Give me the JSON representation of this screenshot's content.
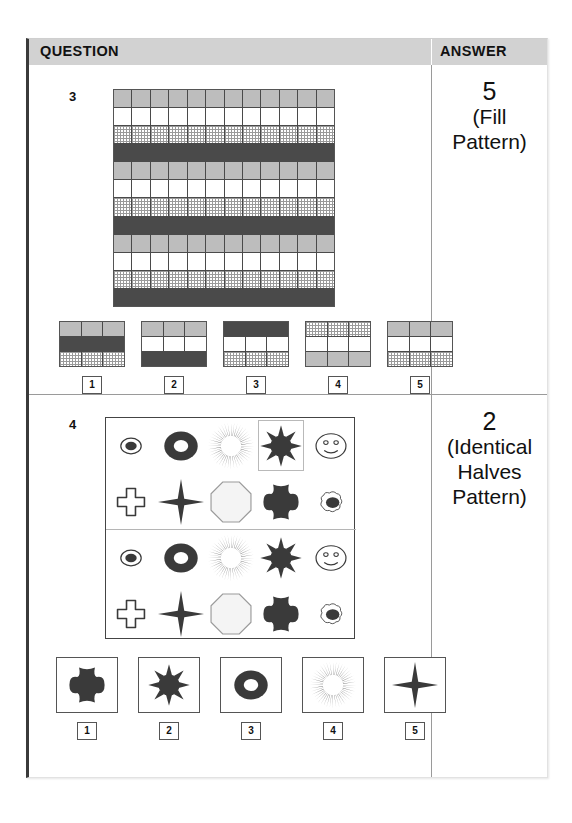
{
  "header": {
    "question_label": "QUESTION",
    "answer_label": "ANSWER"
  },
  "questions": [
    {
      "number": "3",
      "answer_number": "5",
      "answer_note_line1": "(Fill",
      "answer_note_line2": "Pattern)",
      "grid": {
        "columns": 12,
        "rows": 12,
        "row_fills": [
          "gray",
          "white",
          "hatch",
          "dark",
          "gray",
          "white",
          "hatch",
          "dark",
          "gray",
          "white",
          "hatch",
          "dark"
        ]
      },
      "options": [
        {
          "label": "1",
          "rows": [
            "gray",
            "dark",
            "hatch"
          ]
        },
        {
          "label": "2",
          "rows": [
            "gray",
            "white",
            "dark"
          ]
        },
        {
          "label": "3",
          "rows": [
            "dark",
            "white",
            "hatch"
          ]
        },
        {
          "label": "4",
          "rows": [
            "hatch",
            "white",
            "gray"
          ]
        },
        {
          "label": "5",
          "rows": [
            "gray",
            "white",
            "hatch"
          ]
        }
      ]
    },
    {
      "number": "4",
      "answer_number": "2",
      "answer_note_line1": "(Identical",
      "answer_note_line2": "Halves",
      "answer_note_line3": "Pattern)",
      "panel": {
        "top_half": {
          "row1": [
            "dot-in-circle",
            "donut",
            "sunburst",
            "sun-boxed",
            "smiley"
          ],
          "row2": [
            "cross",
            "four-point-star",
            "octagon",
            "blob-cross",
            "scribble-blob"
          ]
        },
        "bottom_half": {
          "row1": [
            "dot-in-circle",
            "donut",
            "sunburst",
            "sun",
            "smiley"
          ],
          "row2": [
            "cross",
            "four-point-star",
            "octagon",
            "blob-cross",
            "scribble-blob"
          ]
        }
      },
      "options": [
        {
          "label": "1",
          "shape": "blob-cross"
        },
        {
          "label": "2",
          "shape": "sun"
        },
        {
          "label": "3",
          "shape": "donut"
        },
        {
          "label": "4",
          "shape": "sunburst"
        },
        {
          "label": "5",
          "shape": "four-point-star"
        }
      ]
    }
  ],
  "colors": {
    "gray_fill": "#bdbdbd",
    "dark_fill": "#4a4a4a",
    "header_band": "#d2d2d2",
    "ink": "#3a3a3a"
  }
}
